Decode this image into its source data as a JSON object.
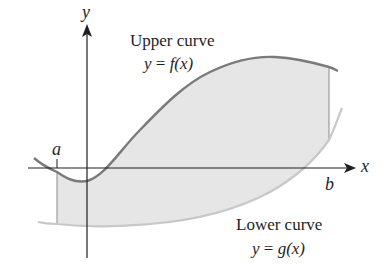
{
  "diagram": {
    "axes": {
      "x_label": "x",
      "y_label": "y"
    },
    "bounds": {
      "a_label": "a",
      "b_label": "b"
    },
    "upper_curve": {
      "title": "Upper curve",
      "equation_lhs": "y",
      "equation_eq": "=",
      "equation_rhs": "f(x)"
    },
    "lower_curve": {
      "title": "Lower curve",
      "equation_lhs": "y",
      "equation_eq": "=",
      "equation_rhs": "g(x)"
    },
    "colors": {
      "curve": "#7a7a7a",
      "fill": "#e6e6e6",
      "axis": "#1f1f1f",
      "lower_curve": "#c8c8c8",
      "bound_line": "#8a8a8a"
    }
  }
}
